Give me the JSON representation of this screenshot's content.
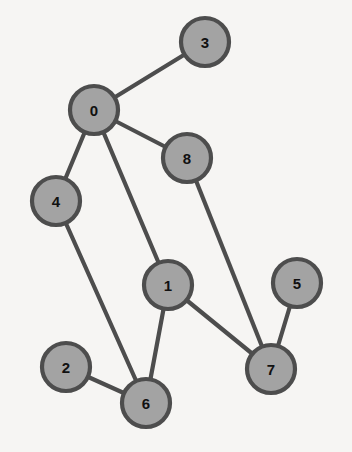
{
  "figure": {
    "background_color": "#f6f5f3",
    "width": 352,
    "height": 452
  },
  "style": {
    "node_fill": "#a3a3a3",
    "node_stroke": "#4d4d4d",
    "node_stroke_width": 4.2,
    "node_radius": 24,
    "edge_color": "#4d4d4d",
    "edge_width": 4.2,
    "label_color": "#111111",
    "label_font_size": 15
  },
  "chart_data": {
    "type": "diagram",
    "graph_type": "undirected-node-link-graph",
    "title": "",
    "node_count": 9,
    "edge_count": 10,
    "nodes": [
      {
        "id": "0",
        "label": "0",
        "x": 94,
        "y": 110,
        "degree": 4
      },
      {
        "id": "1",
        "label": "1",
        "x": 168,
        "y": 285,
        "degree": 3
      },
      {
        "id": "2",
        "label": "2",
        "x": 66,
        "y": 367,
        "degree": 1
      },
      {
        "id": "3",
        "label": "3",
        "x": 205,
        "y": 42,
        "degree": 1
      },
      {
        "id": "4",
        "label": "4",
        "x": 56,
        "y": 201,
        "degree": 2
      },
      {
        "id": "5",
        "label": "5",
        "x": 297,
        "y": 283,
        "degree": 1
      },
      {
        "id": "6",
        "label": "6",
        "x": 146,
        "y": 403,
        "degree": 3
      },
      {
        "id": "7",
        "label": "7",
        "x": 271,
        "y": 369,
        "degree": 3
      },
      {
        "id": "8",
        "label": "8",
        "x": 187,
        "y": 158,
        "degree": 2
      }
    ],
    "edges": [
      {
        "source": "0",
        "target": "3"
      },
      {
        "source": "0",
        "target": "8"
      },
      {
        "source": "0",
        "target": "4"
      },
      {
        "source": "0",
        "target": "1"
      },
      {
        "source": "8",
        "target": "7"
      },
      {
        "source": "4",
        "target": "6"
      },
      {
        "source": "1",
        "target": "7"
      },
      {
        "source": "1",
        "target": "6"
      },
      {
        "source": "2",
        "target": "6"
      },
      {
        "source": "5",
        "target": "7"
      }
    ]
  }
}
